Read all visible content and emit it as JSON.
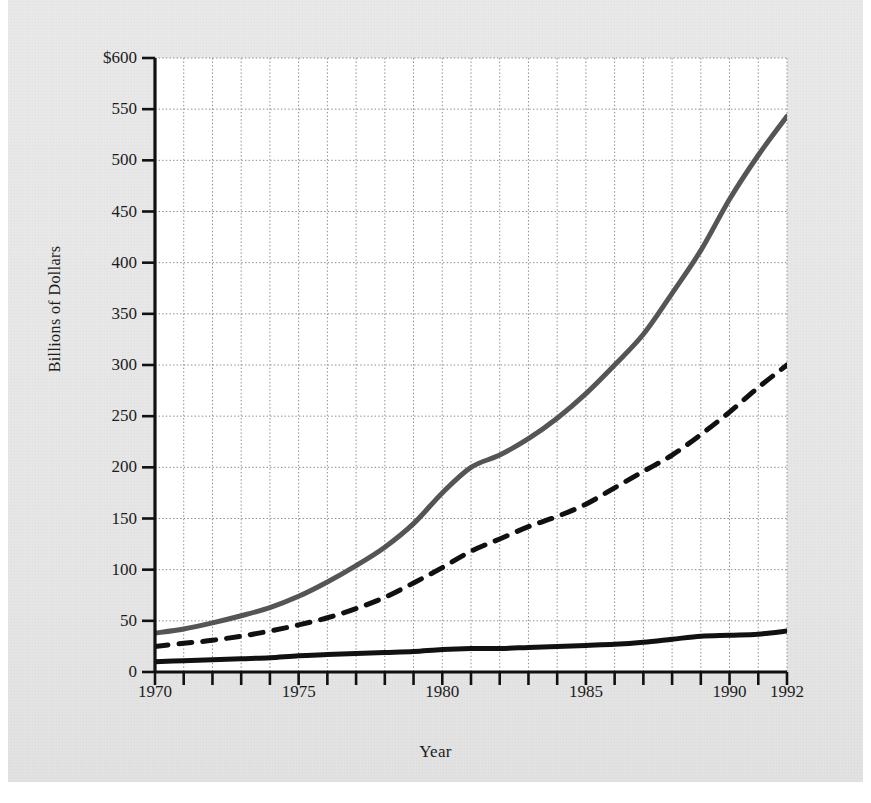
{
  "figure": {
    "background_color": "#e7e7e7",
    "plot_background_color": "#ffffff"
  },
  "chart_data": {
    "type": "line",
    "title": "",
    "subtitle": "",
    "xlabel": "Year",
    "ylabel": "Billions of Dollars",
    "xlim": [
      1970,
      1992
    ],
    "ylim": [
      0,
      600
    ],
    "grid": true,
    "grid_style": "dotted",
    "legend_position": "inline-annotations",
    "y_ticks": [
      0,
      50,
      100,
      150,
      200,
      250,
      300,
      350,
      400,
      450,
      500,
      550,
      600
    ],
    "y_tick_labels": [
      "0",
      "50",
      "100",
      "150",
      "200",
      "250",
      "300",
      "350",
      "400",
      "450",
      "500",
      "550",
      "$600"
    ],
    "x_ticks": [
      1970,
      1971,
      1972,
      1973,
      1974,
      1975,
      1976,
      1977,
      1978,
      1979,
      1980,
      1981,
      1982,
      1983,
      1984,
      1985,
      1986,
      1987,
      1988,
      1989,
      1990,
      1991,
      1992
    ],
    "x_tick_labels_shown": [
      "1970",
      "1975",
      "1980",
      "1985",
      "1990",
      "1992"
    ],
    "x_tick_label_years": [
      1970,
      1975,
      1980,
      1985,
      1990,
      1992
    ],
    "x": [
      1970,
      1971,
      1972,
      1973,
      1974,
      1975,
      1976,
      1977,
      1978,
      1979,
      1980,
      1981,
      1982,
      1983,
      1984,
      1985,
      1986,
      1987,
      1988,
      1989,
      1990,
      1991,
      1992
    ],
    "series": [
      {
        "name": "M2+",
        "label": "M2+",
        "label_html": "M2<sup>+</sup>",
        "color": "#555555",
        "line_style": "solid",
        "line_width": 5,
        "label_x": 1987.1,
        "label_y": 452,
        "values": [
          38,
          42,
          48,
          55,
          63,
          74,
          88,
          104,
          122,
          145,
          175,
          200,
          212,
          228,
          248,
          272,
          300,
          330,
          370,
          412,
          462,
          505,
          543
        ]
      },
      {
        "name": "M2",
        "label": "M2",
        "label_html": "M2",
        "color": "#111111",
        "line_style": "dashed",
        "line_width": 5,
        "label_x": 1987.6,
        "label_y": 272,
        "values": [
          25,
          28,
          31,
          35,
          40,
          46,
          53,
          62,
          73,
          87,
          102,
          118,
          130,
          142,
          152,
          164,
          180,
          196,
          212,
          232,
          254,
          278,
          300
        ]
      },
      {
        "name": "M1",
        "label": "M1",
        "label_html": "M1",
        "color": "#111111",
        "line_style": "solid",
        "line_width": 5,
        "label_x": 1987.0,
        "label_y": 62,
        "values": [
          10,
          11,
          12,
          13,
          14,
          16,
          17,
          18,
          19,
          20,
          22,
          23,
          23,
          24,
          25,
          26,
          27,
          29,
          32,
          35,
          36,
          37,
          40
        ]
      }
    ]
  }
}
